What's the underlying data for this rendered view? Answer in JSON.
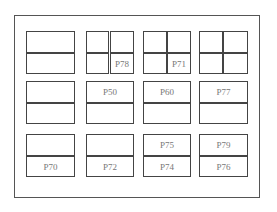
{
  "diagram": {
    "title": "",
    "frame": {
      "stroke": "#555555"
    },
    "colors": {
      "box_stroke": "#444444",
      "label": "#777777",
      "background": "#ffffff"
    },
    "cells": [
      {
        "id": "c1-r1a",
        "label": ""
      },
      {
        "id": "c1-r1b",
        "label": ""
      },
      {
        "id": "c2-r1a-left",
        "label": ""
      },
      {
        "id": "c2-r1a-right",
        "label": ""
      },
      {
        "id": "c2-r1b-left",
        "label": ""
      },
      {
        "id": "c2-r1b-right",
        "label": "P78"
      },
      {
        "id": "c3-r1a-left",
        "label": ""
      },
      {
        "id": "c3-r1a-right",
        "label": ""
      },
      {
        "id": "c3-r1b-left",
        "label": ""
      },
      {
        "id": "c3-r1b-right",
        "label": "P71"
      },
      {
        "id": "c4-r1a-left",
        "label": ""
      },
      {
        "id": "c4-r1a-right",
        "label": ""
      },
      {
        "id": "c4-r1b-left",
        "label": ""
      },
      {
        "id": "c4-r1b-right",
        "label": ""
      },
      {
        "id": "c1-r2a",
        "label": ""
      },
      {
        "id": "c1-r2b",
        "label": ""
      },
      {
        "id": "c2-r2a",
        "label": "P50"
      },
      {
        "id": "c2-r2b",
        "label": ""
      },
      {
        "id": "c3-r2a",
        "label": "P60"
      },
      {
        "id": "c3-r2b",
        "label": ""
      },
      {
        "id": "c4-r2a",
        "label": "P77"
      },
      {
        "id": "c4-r2b",
        "label": ""
      },
      {
        "id": "c1-r3a",
        "label": ""
      },
      {
        "id": "c1-r3b",
        "label": "P70"
      },
      {
        "id": "c2-r3a",
        "label": ""
      },
      {
        "id": "c2-r3b",
        "label": "P72"
      },
      {
        "id": "c3-r3a",
        "label": "P75"
      },
      {
        "id": "c3-r3b",
        "label": "P74"
      },
      {
        "id": "c4-r3a",
        "label": "P79"
      },
      {
        "id": "c4-r3b",
        "label": "P76"
      }
    ]
  }
}
